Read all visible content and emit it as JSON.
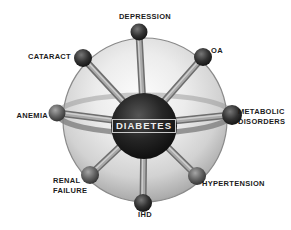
{
  "diagram": {
    "type": "hub-and-spoke-sphere",
    "hub": {
      "label": "DIABETES",
      "sphere_color": "#1a1a1a",
      "text_color": "#ededed"
    },
    "nodes": [
      {
        "id": "depression",
        "label": "DEPRESSION",
        "position": "top"
      },
      {
        "id": "oa",
        "label": "OA",
        "position": "upper-right"
      },
      {
        "id": "metabolic-disorders",
        "label": "METABOLIC\nDISORDERS",
        "position": "right"
      },
      {
        "id": "hypertension",
        "label": "HYPERTENSION",
        "position": "lower-right"
      },
      {
        "id": "ihd",
        "label": "IHD",
        "position": "bottom"
      },
      {
        "id": "renal-failure",
        "label": "RENAL\nFAILURE",
        "position": "lower-left"
      },
      {
        "id": "anemia",
        "label": "ANEMIA",
        "position": "left"
      },
      {
        "id": "cataract",
        "label": "CATARACT",
        "position": "upper-left"
      }
    ],
    "colors": {
      "background": "#ffffff",
      "label_color": "#1c1c1c",
      "sphere_light": "#fbfbfb",
      "sphere_dark": "#8f8f8f",
      "spoke_color": "#7a7a7a"
    }
  }
}
